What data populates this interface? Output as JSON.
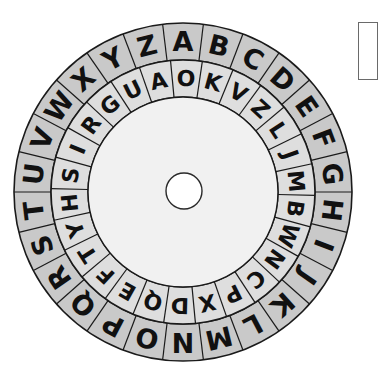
{
  "wheel": {
    "outer_ring": {
      "name": "plaintext alphabet",
      "letters": [
        "A",
        "B",
        "C",
        "D",
        "E",
        "F",
        "G",
        "H",
        "I",
        "J",
        "K",
        "L",
        "M",
        "N",
        "O",
        "P",
        "Q",
        "R",
        "S",
        "T",
        "U",
        "V",
        "W",
        "X",
        "Y",
        "Z"
      ],
      "fill": "#c9c9c9"
    },
    "inner_ring": {
      "name": "cipher alphabet",
      "letters": [
        "O",
        "K",
        "V",
        "Z",
        "L",
        "J",
        "M",
        "B",
        "W",
        "N",
        "C",
        "P",
        "X",
        "D",
        "Q",
        "E",
        "F",
        "T",
        "Y",
        "H",
        "S",
        "I",
        "R",
        "G",
        "U",
        "A"
      ],
      "fill": "#dedede"
    },
    "center_fill": "#f1f1f1",
    "stroke": "#1a1a1a",
    "center_pin": "pivot-hole"
  },
  "side_box": {
    "label": ""
  }
}
